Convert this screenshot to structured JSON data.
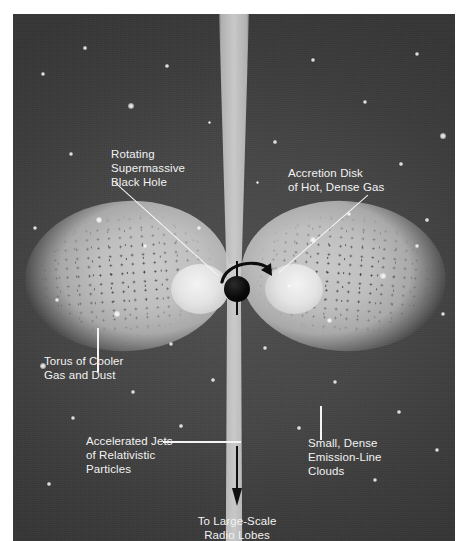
{
  "figure": {
    "background_color": "#464646",
    "jet_color": "#cccccc",
    "torus_color": "#bfbfbf",
    "disk_color": "#eeeeee",
    "black_hole_color": "#000000",
    "label_color": "#f2f2f2"
  },
  "labels": {
    "black_hole": "Rotating\nSupermassive\nBlack Hole",
    "accretion_disk": "Accretion Disk\nof Hot, Dense Gas",
    "torus": "Torus of Cooler\nGas and Dust",
    "jets": "Accelerated Jets\nof Relativistic\nParticles",
    "clouds": "Small, Dense\nEmission-Line\nClouds",
    "radio_lobes": "To Large-Scale\nRadio Lobes"
  },
  "components": {
    "jet_upper": "relativistic-jet-upper",
    "jet_lower": "relativistic-jet-lower",
    "torus_left": "dusty-torus-left-lobe",
    "torus_right": "dusty-torus-right-lobe",
    "disk_left": "accretion-disk-left-lobe",
    "disk_right": "accretion-disk-right-lobe",
    "black_hole": "supermassive-black-hole",
    "rotation_arrow": "rotation-direction-arrow",
    "spin_axis": "spin-axis",
    "down_arrow": "jet-direction-arrow"
  },
  "stars": [
    {
      "x": 30,
      "y": 60,
      "r": 2.2
    },
    {
      "x": 72,
      "y": 34,
      "r": 1.6
    },
    {
      "x": 118,
      "y": 92,
      "r": 2.8
    },
    {
      "x": 58,
      "y": 140,
      "r": 2.0
    },
    {
      "x": 154,
      "y": 52,
      "r": 1.8
    },
    {
      "x": 196,
      "y": 108,
      "r": 1.5
    },
    {
      "x": 300,
      "y": 46,
      "r": 2.4
    },
    {
      "x": 352,
      "y": 88,
      "r": 1.9
    },
    {
      "x": 404,
      "y": 40,
      "r": 2.1
    },
    {
      "x": 430,
      "y": 122,
      "r": 2.6
    },
    {
      "x": 388,
      "y": 150,
      "r": 1.7
    },
    {
      "x": 262,
      "y": 128,
      "r": 1.6
    },
    {
      "x": 22,
      "y": 214,
      "r": 2.3
    },
    {
      "x": 44,
      "y": 286,
      "r": 2.0
    },
    {
      "x": 30,
      "y": 352,
      "r": 2.7
    },
    {
      "x": 86,
      "y": 206,
      "r": 3.0
    },
    {
      "x": 132,
      "y": 232,
      "r": 2.4
    },
    {
      "x": 104,
      "y": 300,
      "r": 2.9
    },
    {
      "x": 158,
      "y": 330,
      "r": 2.2
    },
    {
      "x": 186,
      "y": 214,
      "r": 1.8
    },
    {
      "x": 300,
      "y": 226,
      "r": 2.6
    },
    {
      "x": 336,
      "y": 200,
      "r": 2.1
    },
    {
      "x": 370,
      "y": 262,
      "r": 2.8
    },
    {
      "x": 404,
      "y": 232,
      "r": 2.3
    },
    {
      "x": 430,
      "y": 300,
      "r": 2.0
    },
    {
      "x": 316,
      "y": 306,
      "r": 2.5
    },
    {
      "x": 276,
      "y": 272,
      "r": 1.7
    },
    {
      "x": 252,
      "y": 334,
      "r": 2.2
    },
    {
      "x": 60,
      "y": 404,
      "r": 2.4
    },
    {
      "x": 120,
      "y": 378,
      "r": 1.9
    },
    {
      "x": 168,
      "y": 412,
      "r": 1.6
    },
    {
      "x": 322,
      "y": 368,
      "r": 2.3
    },
    {
      "x": 386,
      "y": 398,
      "r": 1.8
    },
    {
      "x": 424,
      "y": 436,
      "r": 2.1
    },
    {
      "x": 36,
      "y": 470,
      "r": 1.7
    },
    {
      "x": 362,
      "y": 466,
      "r": 2.0
    },
    {
      "x": 414,
      "y": 206,
      "r": 1.6
    },
    {
      "x": 244,
      "y": 168,
      "r": 1.5
    },
    {
      "x": 200,
      "y": 366,
      "r": 1.7
    },
    {
      "x": 286,
      "y": 414,
      "r": 1.6
    }
  ]
}
